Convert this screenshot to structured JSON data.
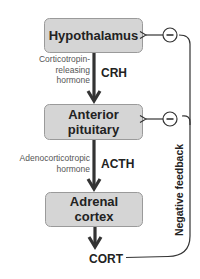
{
  "diagram": {
    "type": "HPA axis flowchart",
    "nodes": [
      {
        "id": "hypothalamus",
        "label_lines": [
          "Hypothalamus"
        ]
      },
      {
        "id": "anterior_pituitary",
        "label_lines": [
          "Anterior",
          "pituitary"
        ]
      },
      {
        "id": "adrenal_cortex",
        "label_lines": [
          "Adrenal",
          "cortex"
        ]
      }
    ],
    "hormones": [
      {
        "abbr": "CRH",
        "name_lines": [
          "Corticotropin-",
          "releasing",
          "hormone"
        ],
        "from": "hypothalamus",
        "to": "anterior_pituitary"
      },
      {
        "abbr": "ACTH",
        "name_lines": [
          "Adenocorticotropic",
          "hormone"
        ],
        "from": "anterior_pituitary",
        "to": "adrenal_cortex"
      }
    ],
    "output": {
      "label": "CORT",
      "from": "adrenal_cortex"
    },
    "feedback": {
      "label": "Negative feedback",
      "symbol": "minus-circle",
      "symbol_text": "−",
      "targets": [
        "hypothalamus",
        "anterior_pituitary"
      ]
    },
    "colors": {
      "box_fill": "#d5d5d5",
      "box_stroke": "#9a9a9a",
      "text": "#222222",
      "subtext": "#555555",
      "arrow": "#333333"
    }
  }
}
